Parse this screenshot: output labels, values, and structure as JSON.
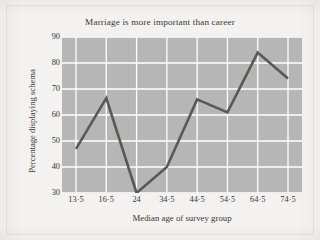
{
  "chart_data": {
    "type": "line",
    "title": "Marriage is more important than career",
    "xlabel": "Median age of survey group",
    "ylabel": "Percentage displaying schema",
    "categories": [
      "13·5",
      "16·5",
      "24",
      "34·5",
      "44·5",
      "54·5",
      "64·5",
      "74·5"
    ],
    "x_numeric": [
      13.5,
      16.5,
      24,
      34.5,
      44.5,
      54.5,
      64.5,
      74.5
    ],
    "values": [
      47,
      66.5,
      30,
      40,
      66,
      61,
      84,
      74
    ],
    "ylim": [
      30,
      90
    ],
    "y_ticks": [
      "30",
      "40",
      "50",
      "60",
      "70",
      "80",
      "90"
    ],
    "y_tick_values": [
      30,
      40,
      50,
      60,
      70,
      80,
      90
    ],
    "grid": true,
    "legend": "none",
    "series_name": "Percentage displaying schema",
    "markers": false
  },
  "style": {
    "plot_background": "#b6b6b6",
    "page_background": "#f3f2f0",
    "grid_color": "#ffffff",
    "line_color": "#5b5854",
    "text_color": "#3a3631"
  }
}
